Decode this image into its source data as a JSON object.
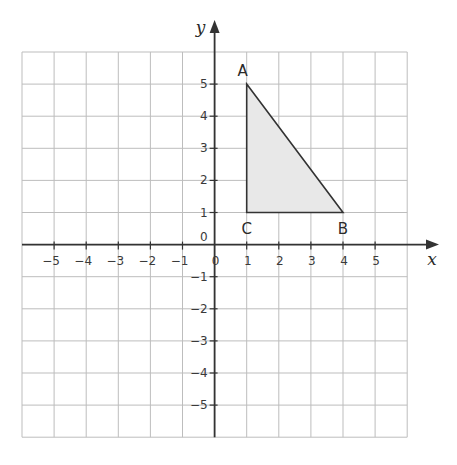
{
  "diagram": {
    "type": "coordinate-grid",
    "x_axis": {
      "label": "x",
      "min": -6,
      "max": 6,
      "tick_labels": [
        "-5",
        "-4",
        "-3",
        "-2",
        "-1",
        "0",
        "1",
        "2",
        "3",
        "4",
        "5"
      ]
    },
    "y_axis": {
      "label": "y",
      "min": -6,
      "max": 6,
      "tick_labels": [
        "5",
        "4",
        "3",
        "2",
        "1",
        "0",
        "-1",
        "-2",
        "-3",
        "-4",
        "-5"
      ]
    },
    "origin_label": "0",
    "triangle": {
      "fill": "#e8e8e8",
      "stroke": "#333333",
      "vertices": [
        {
          "label": "A",
          "x": 1,
          "y": 5
        },
        {
          "label": "B",
          "x": 4,
          "y": 1
        },
        {
          "label": "C",
          "x": 1,
          "y": 1
        }
      ]
    },
    "colors": {
      "grid": "#bdbdbd",
      "axis": "#333333"
    }
  }
}
